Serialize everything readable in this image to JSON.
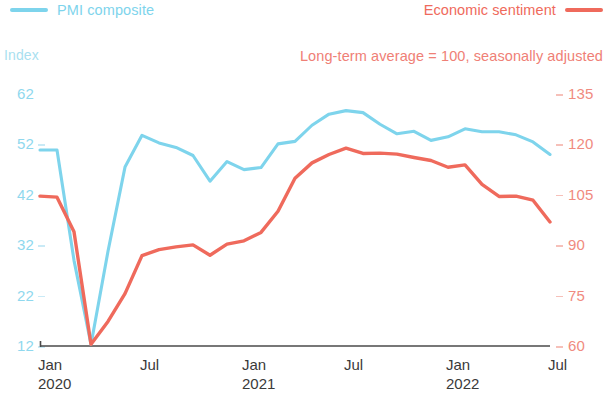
{
  "legend": {
    "series_left": {
      "label": "PMI composite",
      "color": "#7ed4ec",
      "swatch": "line-swatch-icon"
    },
    "series_right": {
      "label": "Economic sentiment",
      "color": "#ef6a5c",
      "swatch": "line-swatch-icon"
    }
  },
  "axis_title_left": "Index",
  "subtitle": "Long-term average = 100, seasonally adjusted",
  "chart_data": {
    "type": "line",
    "title": "",
    "subtitle": "Long-term average = 100, seasonally adjusted",
    "xlabel": "",
    "ylabel": "Index",
    "grid": false,
    "legend_position": "top",
    "x": [
      "Jan 2020",
      "Feb 2020",
      "Mar 2020",
      "Apr 2020",
      "May 2020",
      "Jun 2020",
      "Jul 2020",
      "Aug 2020",
      "Sep 2020",
      "Oct 2020",
      "Nov 2020",
      "Dec 2020",
      "Jan 2021",
      "Feb 2021",
      "Mar 2021",
      "Apr 2021",
      "May 2021",
      "Jun 2021",
      "Jul 2021",
      "Aug 2021",
      "Sep 2021",
      "Oct 2021",
      "Nov 2021",
      "Dec 2021",
      "Jan 2022",
      "Feb 2022",
      "Mar 2022",
      "Apr 2022",
      "May 2022",
      "Jun 2022",
      "Jul 2022"
    ],
    "xtick_labels": [
      {
        "month": "Jan",
        "year": "2020"
      },
      {
        "month": "Jul",
        "year": ""
      },
      {
        "month": "Jan",
        "year": "2021"
      },
      {
        "month": "Jul",
        "year": ""
      },
      {
        "month": "Jan",
        "year": "2022"
      },
      {
        "month": "Jul",
        "year": ""
      }
    ],
    "axes": [
      {
        "id": "left",
        "label": "Index",
        "color": "#8fd8ee",
        "ticks": [
          62,
          52,
          42,
          32,
          22,
          12
        ],
        "ylim": [
          12,
          62
        ]
      },
      {
        "id": "right",
        "label": "",
        "color": "#f08b80",
        "ticks": [
          135,
          120,
          105,
          90,
          75,
          60
        ],
        "ylim": [
          60,
          135
        ]
      }
    ],
    "series": [
      {
        "name": "PMI composite",
        "color": "#7ed4ec",
        "axis": "left",
        "values": [
          50.9,
          50.9,
          29.0,
          12.3,
          30.8,
          47.5,
          53.8,
          52.3,
          51.4,
          49.8,
          44.7,
          48.6,
          47.0,
          47.4,
          52.1,
          52.6,
          55.8,
          58.0,
          58.7,
          58.3,
          56.0,
          54.1,
          54.6,
          52.8,
          53.5,
          55.1,
          54.5,
          54.5,
          53.9,
          52.5,
          50.0
        ]
      },
      {
        "name": "Economic sentiment",
        "color": "#ef6a5c",
        "axis": "right",
        "values": [
          104.6,
          104.3,
          94.0,
          60.5,
          67.3,
          75.6,
          86.9,
          88.7,
          89.5,
          90.1,
          87.0,
          90.3,
          91.3,
          93.8,
          100.1,
          109.9,
          114.5,
          117.0,
          118.9,
          117.3,
          117.4,
          117.1,
          116.1,
          115.2,
          113.2,
          113.9,
          108.1,
          104.5,
          104.6,
          103.4,
          96.9
        ]
      }
    ]
  },
  "colors": {
    "blue": "#7ed4ec",
    "red": "#ef6a5c",
    "axis_line": "#4a4a4a",
    "xtick_text": "#3a3a3a"
  }
}
